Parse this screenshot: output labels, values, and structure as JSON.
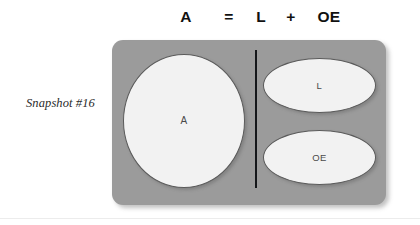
{
  "equation": {
    "left_term": "A",
    "equals": "=",
    "term_1": "L",
    "plus": "+",
    "term_2": "OE"
  },
  "caption": {
    "text": "Snapshot #16"
  },
  "diagram": {
    "panel_color": "#9b9b9b",
    "shape_fill": "#f2f2f2",
    "shape_stroke": "#5a5a5a",
    "divider_color": "#15171a",
    "shapes": [
      {
        "id": "assets",
        "label": "A",
        "type": "circle"
      },
      {
        "id": "liabilities",
        "label": "L",
        "type": "ellipse"
      },
      {
        "id": "owners-equity",
        "label": "OE",
        "type": "ellipse"
      }
    ]
  }
}
